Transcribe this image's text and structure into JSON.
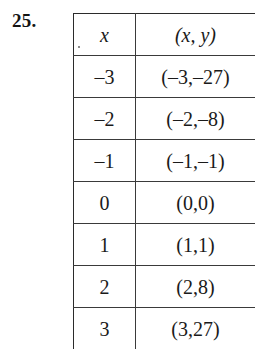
{
  "exercise": {
    "number_label": "25."
  },
  "table": {
    "headers": [
      "x",
      "(x, y)"
    ],
    "rows": [
      {
        "x": "–3",
        "pair": "(–3,–27)"
      },
      {
        "x": "–2",
        "pair": "(–2,–8)"
      },
      {
        "x": "–1",
        "pair": "(–1,–1)"
      },
      {
        "x": "0",
        "pair": "(0,0)"
      },
      {
        "x": "1",
        "pair": "(1,1)"
      },
      {
        "x": "2",
        "pair": "(2,8)"
      },
      {
        "x": "3",
        "pair": "(3,27)"
      }
    ]
  },
  "chart_data": {
    "type": "table",
    "title": "",
    "xlabel": "x",
    "ylabel": "(x, y)",
    "categories": [
      "-3",
      "-2",
      "-1",
      "0",
      "1",
      "2",
      "3"
    ],
    "x": [
      -3,
      -2,
      -1,
      0,
      1,
      2,
      3
    ],
    "values": [
      -27,
      -8,
      -1,
      0,
      1,
      8,
      27
    ],
    "columns": [
      "x",
      "(x, y)"
    ],
    "cells": [
      [
        "–3",
        "(–3,–27)"
      ],
      [
        "–2",
        "(–2,–8)"
      ],
      [
        "–1",
        "(–1,–1)"
      ],
      [
        "0",
        "(0,0)"
      ],
      [
        "1",
        "(1,1)"
      ],
      [
        "2",
        "(2,8)"
      ],
      [
        "3",
        "(3,27)"
      ]
    ]
  },
  "colors": {
    "background": "#ffffff",
    "text": "#1a1a1a",
    "rule": "#3a3a3a"
  }
}
